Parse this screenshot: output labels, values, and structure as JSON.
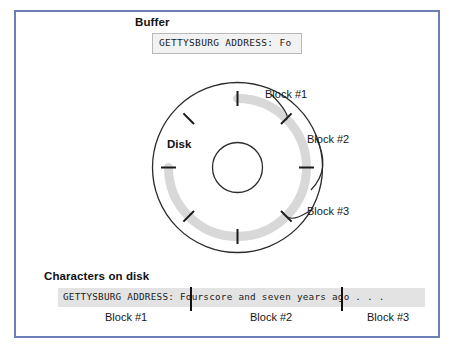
{
  "figure": {
    "frame_color": "#6b7fb5",
    "track_color": "#d8d8d8",
    "background": "#ffffff"
  },
  "buffer": {
    "heading": "Buffer",
    "content": "GETTYSBURG ADDRESS: Fo",
    "box_fill": "#f2f2f2",
    "box_border": "#b9b9b9"
  },
  "disk": {
    "label": "Disk",
    "callouts": [
      {
        "label": "Block #1"
      },
      {
        "label": "Block #2"
      },
      {
        "label": "Block #3"
      }
    ],
    "sector_tick_count": 8
  },
  "characters_on_disk": {
    "heading": "Characters on disk",
    "full_text": "GETTYSBURG ADDRESS: Fourscore and seven years ago . . .",
    "segments": [
      {
        "block": "Block #1",
        "text": "GETTYSBURG ADDRESS: Fo"
      },
      {
        "block": "Block #2",
        "text": "urscore and seven year"
      },
      {
        "block": "Block #3",
        "text": "s ago . . ."
      }
    ],
    "strip_fill": "#e3e3e3",
    "block_labels": [
      "Block #1",
      "Block #2",
      "Block #3"
    ]
  }
}
